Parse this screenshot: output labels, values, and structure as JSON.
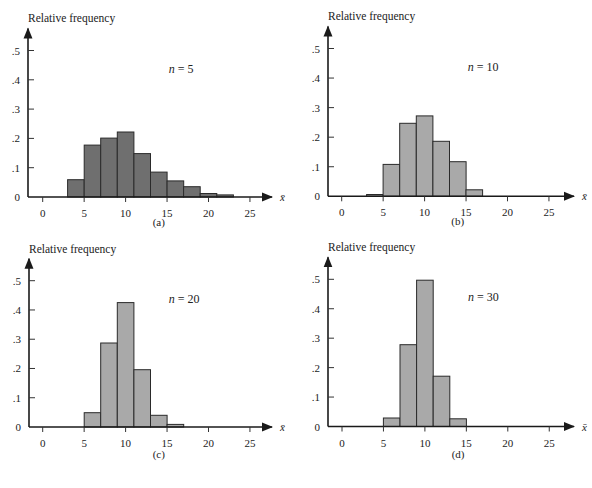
{
  "figure": {
    "panels_caption_style": "(letter)"
  },
  "chart_data": [
    {
      "type": "bar",
      "panel": "a",
      "caption": "(a)",
      "annotation": "n = 5",
      "n_symbol": "n",
      "n_value": "5",
      "title": "",
      "xlabel": "x̄",
      "ylabel": "Relative frequency",
      "bin_width": 2,
      "bin_edges": [
        3,
        5,
        7,
        9,
        11,
        13,
        15,
        17,
        19,
        21,
        23
      ],
      "categories": [
        "3-5",
        "5-7",
        "7-9",
        "9-11",
        "11-13",
        "13-15",
        "15-17",
        "17-19",
        "19-21",
        "21-23"
      ],
      "values": [
        0.059,
        0.177,
        0.201,
        0.222,
        0.148,
        0.085,
        0.055,
        0.035,
        0.012,
        0.007
      ],
      "xlim": [
        0,
        25
      ],
      "ylim": [
        0,
        0.5
      ],
      "xticks": [
        "0",
        "5",
        "10",
        "15",
        "20",
        "25"
      ],
      "yticks": [
        "0",
        ".1",
        ".2",
        ".3",
        ".4",
        ".5"
      ],
      "bar_color": "#6f6f6f",
      "grid": false,
      "legend": null
    },
    {
      "type": "bar",
      "panel": "b",
      "caption": "(b)",
      "annotation": "n = 10",
      "n_symbol": "n",
      "n_value": "10",
      "title": "",
      "xlabel": "x̄",
      "ylabel": "Relative frequency",
      "bin_width": 2,
      "bin_edges": [
        3,
        5,
        7,
        9,
        11,
        13,
        15,
        17
      ],
      "categories": [
        "3-5",
        "5-7",
        "7-9",
        "9-11",
        "11-13",
        "13-15",
        "15-17"
      ],
      "values": [
        0.006,
        0.108,
        0.247,
        0.272,
        0.186,
        0.117,
        0.022
      ],
      "xlim": [
        0,
        25
      ],
      "ylim": [
        0,
        0.5
      ],
      "xticks": [
        "0",
        "5",
        "10",
        "15",
        "20",
        "25"
      ],
      "yticks": [
        "0",
        ".1",
        ".2",
        ".3",
        ".4",
        ".5"
      ],
      "bar_color": "#a9a9a9",
      "grid": false,
      "legend": null
    },
    {
      "type": "bar",
      "panel": "c",
      "caption": "(c)",
      "annotation": "n = 20",
      "n_symbol": "n",
      "n_value": "20",
      "title": "",
      "xlabel": "x̄",
      "ylabel": "Relative frequency",
      "bin_width": 2,
      "bin_edges": [
        5,
        7,
        9,
        11,
        13,
        15,
        17
      ],
      "categories": [
        "5-7",
        "7-9",
        "9-11",
        "11-13",
        "13-15",
        "15-17"
      ],
      "values": [
        0.049,
        0.287,
        0.425,
        0.196,
        0.04,
        0.009
      ],
      "xlim": [
        0,
        25
      ],
      "ylim": [
        0,
        0.5
      ],
      "xticks": [
        "0",
        "5",
        "10",
        "15",
        "20",
        "25"
      ],
      "yticks": [
        "0",
        ".1",
        ".2",
        ".3",
        ".4",
        ".5"
      ],
      "bar_color": "#a9a9a9",
      "grid": false,
      "legend": null
    },
    {
      "type": "bar",
      "panel": "d",
      "caption": "(d)",
      "annotation": "n = 30",
      "n_symbol": "n",
      "n_value": "30",
      "title": "",
      "xlabel": "x̄",
      "ylabel": "Relative frequency",
      "bin_width": 2,
      "bin_edges": [
        5,
        7,
        9,
        11,
        13,
        15
      ],
      "categories": [
        "5-7",
        "7-9",
        "9-11",
        "11-13",
        "13-15"
      ],
      "values": [
        0.029,
        0.278,
        0.497,
        0.171,
        0.026
      ],
      "xlim": [
        0,
        25
      ],
      "ylim": [
        0,
        0.5
      ],
      "xticks": [
        "0",
        "5",
        "10",
        "15",
        "20",
        "25"
      ],
      "yticks": [
        "0",
        ".1",
        ".2",
        ".3",
        ".4",
        ".5"
      ],
      "bar_color": "#a9a9a9",
      "grid": false,
      "legend": null
    }
  ]
}
